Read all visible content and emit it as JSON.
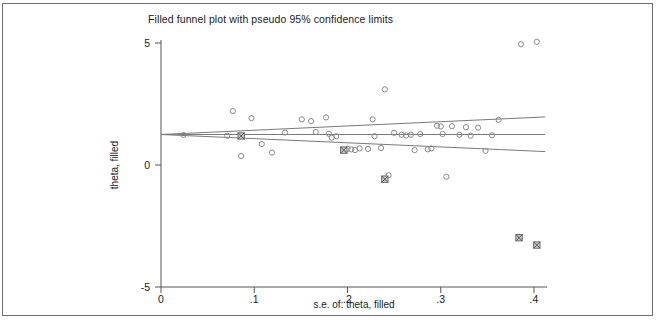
{
  "chart_data": {
    "type": "scatter",
    "title": "Filled funnel plot with pseudo 95% confidence limits",
    "xlabel": "s.e. of: theta, filled",
    "ylabel": "theta, filled",
    "xlim": [
      0,
      0.415
    ],
    "ylim": [
      -6.1,
      6.1
    ],
    "xticks": [
      0,
      0.1,
      0.2,
      0.3,
      0.4
    ],
    "xticklabels": [
      "0",
      ".1",
      ".2",
      ".3",
      ".4"
    ],
    "yticks": [
      5,
      0,
      -5
    ],
    "yticklabels": [
      "5",
      "0",
      "-5"
    ],
    "grid": false,
    "legend": null,
    "pooled_effect": 1.25,
    "pooled_line": {
      "name": "pooled effect estimate",
      "x": [
        0,
        0.412
      ],
      "y": [
        1.25,
        1.25
      ]
    },
    "ci_lines": [
      {
        "name": "pseudo 95% upper confidence limit",
        "x": [
          0,
          0.412
        ],
        "y": [
          1.25,
          1.97
        ]
      },
      {
        "name": "pseudo 95% lower confidence limit",
        "x": [
          0,
          0.412
        ],
        "y": [
          1.25,
          0.55
        ]
      }
    ],
    "series": [
      {
        "name": "Observed studies",
        "marker": "open-circle",
        "color": "#8a8a8a",
        "points": [
          {
            "x": 0.024,
            "y": 1.23
          },
          {
            "x": 0.071,
            "y": 1.2
          },
          {
            "x": 0.077,
            "y": 2.21
          },
          {
            "x": 0.086,
            "y": 0.37
          },
          {
            "x": 0.097,
            "y": 1.92
          },
          {
            "x": 0.108,
            "y": 0.86
          },
          {
            "x": 0.119,
            "y": 0.51
          },
          {
            "x": 0.133,
            "y": 1.33
          },
          {
            "x": 0.151,
            "y": 1.87
          },
          {
            "x": 0.161,
            "y": 1.8
          },
          {
            "x": 0.166,
            "y": 1.35
          },
          {
            "x": 0.177,
            "y": 1.95
          },
          {
            "x": 0.18,
            "y": 1.28
          },
          {
            "x": 0.183,
            "y": 1.12
          },
          {
            "x": 0.188,
            "y": 1.18
          },
          {
            "x": 0.196,
            "y": 0.61
          },
          {
            "x": 0.2,
            "y": 0.66
          },
          {
            "x": 0.204,
            "y": 0.64
          },
          {
            "x": 0.208,
            "y": 0.61
          },
          {
            "x": 0.213,
            "y": 0.68
          },
          {
            "x": 0.222,
            "y": 0.66
          },
          {
            "x": 0.227,
            "y": 1.87
          },
          {
            "x": 0.229,
            "y": 1.18
          },
          {
            "x": 0.236,
            "y": 0.7
          },
          {
            "x": 0.24,
            "y": 3.1
          },
          {
            "x": 0.244,
            "y": -0.42
          },
          {
            "x": 0.25,
            "y": 1.32
          },
          {
            "x": 0.258,
            "y": 1.24
          },
          {
            "x": 0.263,
            "y": 1.21
          },
          {
            "x": 0.268,
            "y": 1.24
          },
          {
            "x": 0.272,
            "y": 0.61
          },
          {
            "x": 0.278,
            "y": 1.27
          },
          {
            "x": 0.286,
            "y": 0.64
          },
          {
            "x": 0.29,
            "y": 0.68
          },
          {
            "x": 0.296,
            "y": 1.61
          },
          {
            "x": 0.3,
            "y": 1.58
          },
          {
            "x": 0.302,
            "y": 1.27
          },
          {
            "x": 0.306,
            "y": -0.48
          },
          {
            "x": 0.312,
            "y": 1.59
          },
          {
            "x": 0.32,
            "y": 1.24
          },
          {
            "x": 0.327,
            "y": 1.55
          },
          {
            "x": 0.332,
            "y": 1.2
          },
          {
            "x": 0.34,
            "y": 1.53
          },
          {
            "x": 0.348,
            "y": 0.58
          },
          {
            "x": 0.355,
            "y": 1.22
          },
          {
            "x": 0.362,
            "y": 1.85
          },
          {
            "x": 0.386,
            "y": 4.95
          },
          {
            "x": 0.403,
            "y": 5.05
          }
        ]
      },
      {
        "name": "Filled (imputed) studies",
        "marker": "crossed-square",
        "color": "#6e6e6e",
        "points": [
          {
            "x": 0.086,
            "y": 1.19
          },
          {
            "x": 0.196,
            "y": 0.61
          },
          {
            "x": 0.24,
            "y": -0.58
          },
          {
            "x": 0.384,
            "y": -2.98
          },
          {
            "x": 0.403,
            "y": -3.28
          }
        ]
      }
    ]
  },
  "icons": {
    "open_circle": "observed-study-marker",
    "crossed_square": "filled-study-marker"
  }
}
